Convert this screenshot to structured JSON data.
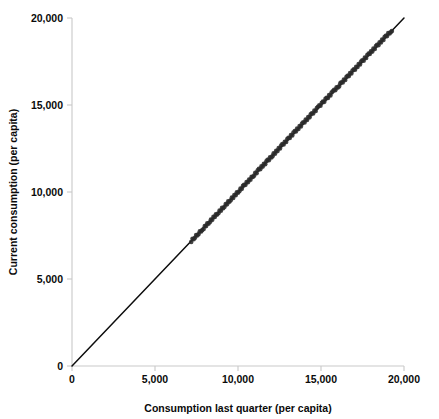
{
  "chart_data": {
    "type": "scatter",
    "title": "",
    "xlabel": "Consumption last quarter (per capita)",
    "ylabel": "Current consumption (per capita)",
    "xlim": [
      0,
      20000
    ],
    "ylim": [
      0,
      20000
    ],
    "xticks": [
      0,
      5000,
      10000,
      15000,
      20000
    ],
    "yticks": [
      0,
      5000,
      10000,
      15000,
      20000
    ],
    "xticklabels": [
      "0",
      "5,000",
      "10,000",
      "15,000",
      "20,000"
    ],
    "yticklabels": [
      "0",
      "5,000",
      "10,000",
      "15,000",
      "20,000"
    ],
    "grid": false,
    "legend": false,
    "annotations": [],
    "reference_line": {
      "name": "45-degree line",
      "slope": 1,
      "intercept": 0,
      "from": [
        0,
        0
      ],
      "to": [
        20000,
        20000
      ],
      "color": "#0d0d0d"
    },
    "series": [
      {
        "name": "Households",
        "marker": "circle",
        "color": "#2a2a2a",
        "x": [
          7180,
          7260,
          7330,
          7410,
          7480,
          7560,
          7630,
          7700,
          7780,
          7850,
          7930,
          8000,
          8080,
          8150,
          8220,
          8300,
          8370,
          8450,
          8520,
          8600,
          8670,
          8740,
          8820,
          8890,
          8970,
          9040,
          9110,
          9190,
          9260,
          9340,
          9410,
          9480,
          9560,
          9630,
          9710,
          9780,
          9860,
          9930,
          10000,
          10080,
          10150,
          10230,
          10300,
          10370,
          10450,
          10520,
          10600,
          10670,
          10750,
          10820,
          10890,
          10970,
          11040,
          11120,
          11190,
          11260,
          11340,
          11410,
          11490,
          11560,
          11640,
          11710,
          11780,
          11860,
          11930,
          12010,
          12080,
          12150,
          12230,
          12300,
          12380,
          12450,
          12530,
          12600,
          12670,
          12750,
          12820,
          12900,
          12970,
          13040,
          13120,
          13190,
          13270,
          13340,
          13420,
          13490,
          13560,
          13640,
          13710,
          13790,
          13860,
          13930,
          14010,
          14080,
          14160,
          14230,
          14310,
          14380,
          14450,
          14530,
          14600,
          14680,
          14750,
          14820,
          14900,
          14970,
          15050,
          15120,
          15200,
          15270,
          15340,
          15420,
          15490,
          15570,
          15640,
          15710,
          15790,
          15860,
          15940,
          16010,
          16090,
          16160,
          16230,
          16310,
          16380,
          16460,
          16530,
          16600,
          16680,
          16750,
          16830,
          16900,
          16980,
          17050,
          17120,
          17200,
          17270,
          17350,
          17420,
          17490,
          17570,
          17640,
          17720,
          17790,
          17870,
          17940,
          18010,
          18090,
          18160,
          18240,
          18310,
          18380,
          18460,
          18530,
          18610,
          18680,
          18760,
          18830,
          18900,
          18980,
          19050,
          19130,
          19200,
          19270
        ],
        "y": [
          7130,
          7310,
          7290,
          7370,
          7530,
          7510,
          7590,
          7740,
          7730,
          7820,
          7880,
          8050,
          8040,
          8200,
          8180,
          8260,
          8420,
          8400,
          8570,
          8560,
          8720,
          8700,
          8780,
          8940,
          8920,
          9090,
          9070,
          9150,
          9310,
          9290,
          9460,
          9440,
          9520,
          9680,
          9660,
          9830,
          9810,
          9980,
          9960,
          10040,
          10200,
          10180,
          10350,
          10420,
          10410,
          10570,
          10560,
          10720,
          10710,
          10880,
          10860,
          10940,
          11100,
          11080,
          11250,
          11330,
          11310,
          11470,
          11460,
          11620,
          11600,
          11770,
          11850,
          11830,
          12000,
          11980,
          12060,
          12220,
          12200,
          12370,
          12350,
          12520,
          12500,
          12670,
          12750,
          12730,
          12890,
          12880,
          13040,
          13120,
          13100,
          13270,
          13250,
          13420,
          13500,
          13480,
          13640,
          13620,
          13790,
          13770,
          13940,
          14010,
          13990,
          14160,
          14140,
          14310,
          14290,
          14460,
          14530,
          14510,
          14680,
          14660,
          14830,
          14900,
          14980,
          14960,
          15130,
          15200,
          15180,
          15350,
          15420,
          15400,
          15570,
          15550,
          15720,
          15790,
          15870,
          15850,
          16020,
          16000,
          16070,
          16240,
          16310,
          16290,
          16460,
          16440,
          16610,
          16680,
          16660,
          16830,
          16810,
          16980,
          17050,
          17030,
          17200,
          17180,
          17350,
          17330,
          17500,
          17570,
          17550,
          17720,
          17700,
          17870,
          17950,
          17930,
          18090,
          18070,
          18240,
          18220,
          18390,
          18460,
          18440,
          18610,
          18590,
          18760,
          18740,
          18910,
          18980,
          18960,
          19130,
          19110,
          19180,
          19250
        ]
      }
    ]
  },
  "geometry": {
    "plot_left": 72,
    "plot_right": 404,
    "plot_top": 18,
    "plot_bottom": 366
  },
  "colors": {
    "axis": "#c9c9c9",
    "text": "#0a0a0a",
    "line": "#0d0d0d",
    "points": "#2a2a2a",
    "background": "#ffffff"
  }
}
